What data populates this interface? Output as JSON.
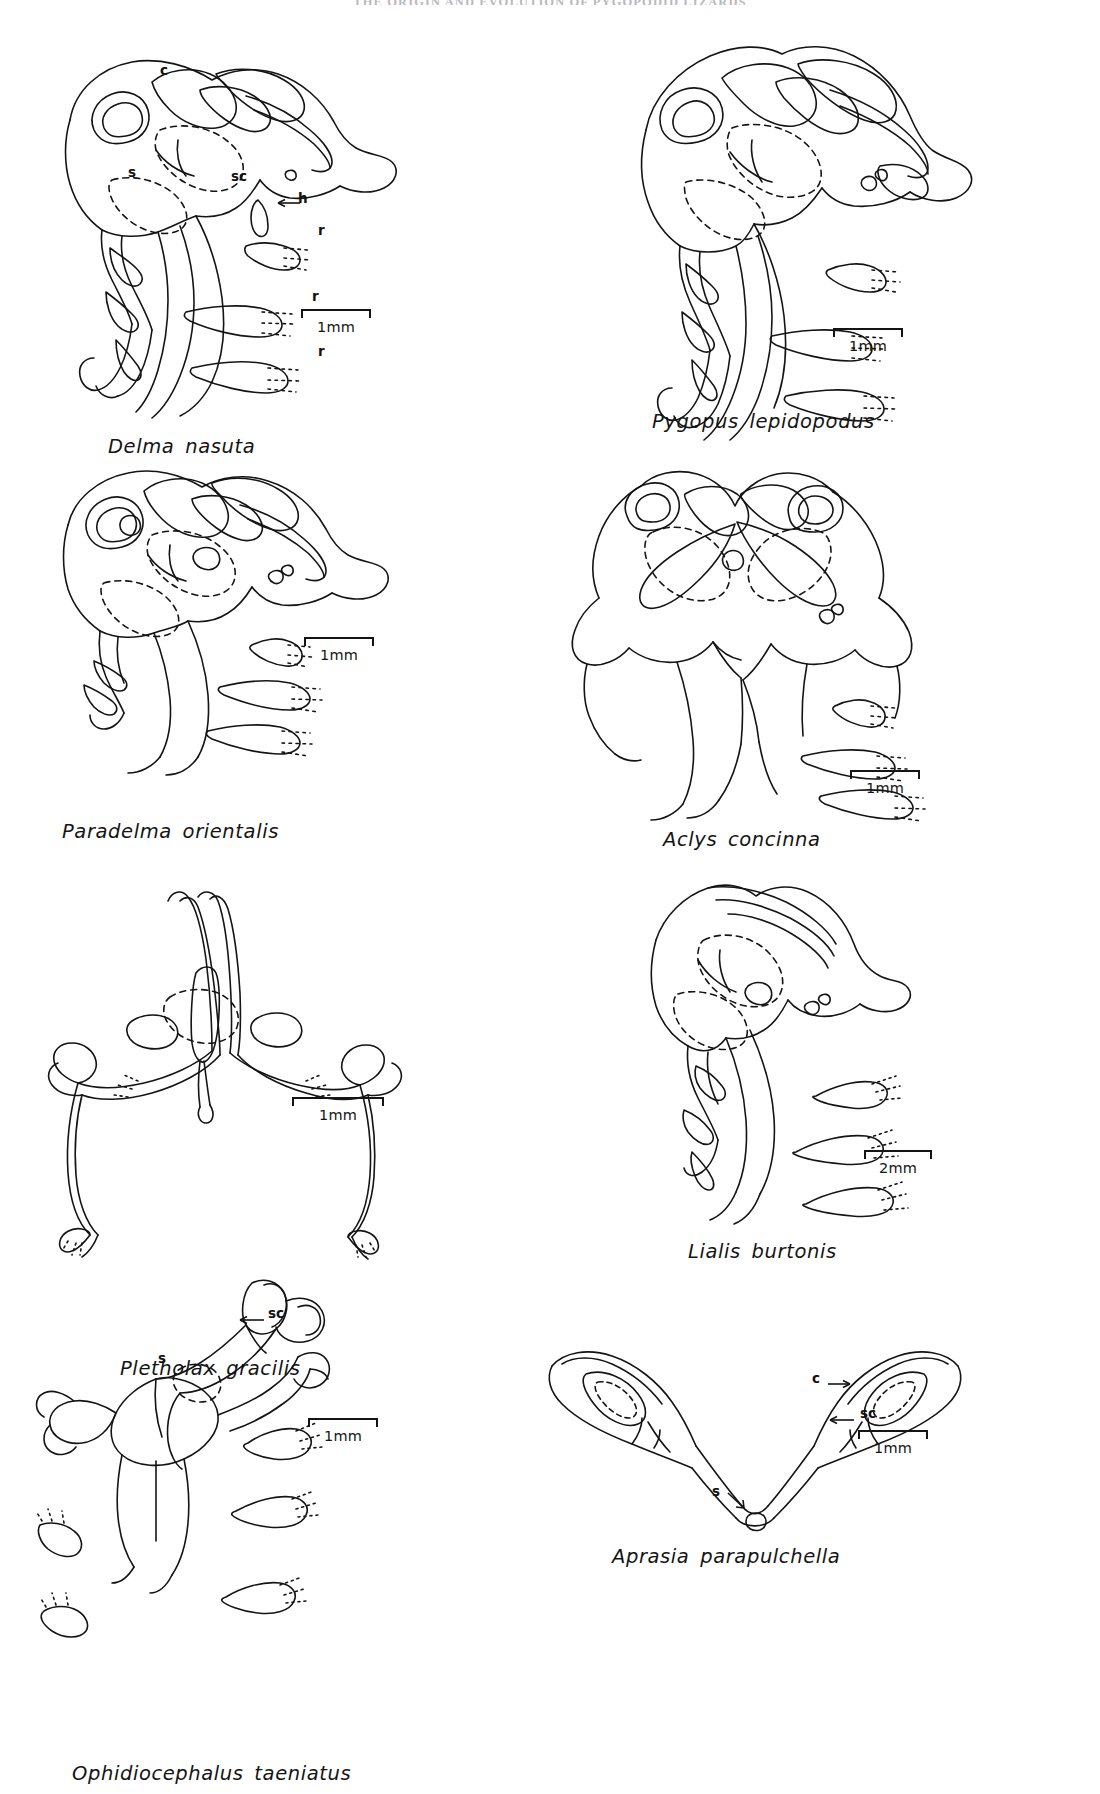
{
  "page": {
    "running_head": "THE ORIGIN AND EVOLUTION OF PYGOPODID LIZARDS",
    "width": 1100,
    "height": 1794,
    "background": "#ffffff",
    "ink": "#141414"
  },
  "figure": {
    "type": "line-drawing-plate",
    "panel_count": 8
  },
  "legend": {
    "c": "clavicle",
    "s": "sternum",
    "sc": "scapulocoracoid",
    "h": "humerus",
    "r": "rib"
  },
  "panels": [
    {
      "id": "delma-nasuta",
      "species": "Delma nasuta",
      "scale": "1mm",
      "annotations": [
        {
          "key": "c",
          "label": "c",
          "arrow": "none"
        },
        {
          "key": "s",
          "label": "s",
          "arrow": "none"
        },
        {
          "key": "sc",
          "label": "sc",
          "arrow": "none"
        },
        {
          "key": "h",
          "label": "h",
          "arrow": "left"
        },
        {
          "key": "r1",
          "label": "r",
          "arrow": "none"
        },
        {
          "key": "r2",
          "label": "r",
          "arrow": "none"
        },
        {
          "key": "r3",
          "label": "r",
          "arrow": "none"
        }
      ]
    },
    {
      "id": "pygopus-lepidopodus",
      "species": "Pygopus lepidopodus",
      "scale": "1mm",
      "annotations": []
    },
    {
      "id": "paradelma-orientalis",
      "species": "Paradelma orientalis",
      "scale": "1mm",
      "annotations": []
    },
    {
      "id": "aclys-concinna",
      "species": "Aclys concinna",
      "scale": "1mm",
      "annotations": []
    },
    {
      "id": "pletholax-gracilis",
      "species": "Pletholax gracilis",
      "scale": "1mm",
      "annotations": []
    },
    {
      "id": "lialis-burtonis",
      "species": "Lialis burtonis",
      "scale": "2mm",
      "annotations": []
    },
    {
      "id": "ophidiocephalus-taeniatus",
      "species": "Ophidiocephalus taeniatus",
      "scale": "1mm",
      "annotations": [
        {
          "key": "sc",
          "label": "sc",
          "arrow": "left"
        },
        {
          "key": "s",
          "label": "s",
          "arrow": "none"
        }
      ]
    },
    {
      "id": "aprasia-parapulchella",
      "species": "Aprasia parapulchella",
      "scale": "1mm",
      "annotations": [
        {
          "key": "c",
          "label": "c",
          "arrow": "right"
        },
        {
          "key": "sc",
          "label": "sc",
          "arrow": "left"
        },
        {
          "key": "s",
          "label": "s",
          "arrow": "down-right"
        }
      ]
    }
  ]
}
